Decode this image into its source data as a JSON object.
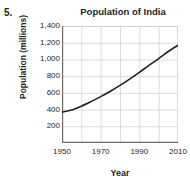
{
  "problem": {
    "number": "5."
  },
  "chart_data": {
    "type": "line",
    "title": "Population of India",
    "xlabel": "Year",
    "ylabel": "Population (millions)",
    "xlim": [
      1950,
      2010
    ],
    "ylim": [
      0,
      1400
    ],
    "grid": true,
    "legend": false,
    "x_ticks": [
      1950,
      1970,
      1990,
      2010
    ],
    "x_tick_labels": [
      "1950",
      "1970",
      "1990",
      "2010"
    ],
    "x_minor_ticks": [
      1960,
      1980,
      2000
    ],
    "y_ticks": [
      200,
      400,
      600,
      800,
      1000,
      1200,
      1400
    ],
    "y_tick_labels": [
      "200",
      "400",
      "600",
      "800",
      "1,000",
      "1,200",
      "1,400"
    ],
    "series": [
      {
        "name": "Population of India",
        "color": "#231f20",
        "x": [
          1950,
          1955,
          1960,
          1965,
          1970,
          1975,
          1980,
          1985,
          1990,
          1995,
          2000,
          2005,
          2010
        ],
        "values": [
          370,
          395,
          440,
          495,
          555,
          620,
          690,
          765,
          845,
          930,
          1010,
          1095,
          1170
        ]
      }
    ]
  },
  "axis_colors": {
    "grid": "#c9cdd3",
    "axis": "#6d6e71",
    "line": "#231f20"
  }
}
